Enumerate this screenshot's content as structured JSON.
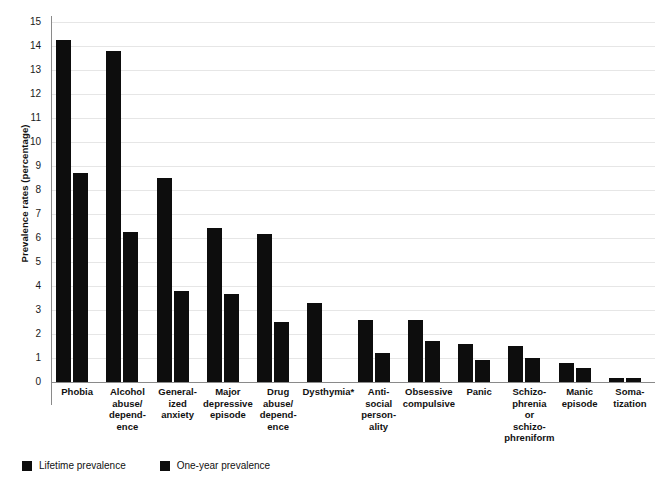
{
  "chart_data": {
    "type": "bar",
    "title": "",
    "subtitle": "",
    "xlabel": "",
    "ylabel": "Prevalence rates (percentage)",
    "ylim": [
      0,
      15
    ],
    "ytick_labels": [
      "0",
      "1",
      "2",
      "3",
      "4",
      "5",
      "6",
      "7",
      "8",
      "9",
      "10",
      "11",
      "12",
      "13",
      "14",
      "15"
    ],
    "ytick_values": [
      0,
      1,
      2,
      3,
      4,
      5,
      6,
      7,
      8,
      9,
      10,
      11,
      12,
      13,
      14,
      15
    ],
    "grid": true,
    "legend_position": "bottom-left",
    "bar_color": "#0d0d0d",
    "categories": [
      "Phobia",
      "Alcohol\nabuse/\ndepend-\nence",
      "General-\nized\nanxiety",
      "Major\ndepressive\nepisode",
      "Drug\nabuse/\ndepend-\nence",
      "Dysthymia*",
      "Anti-\nsocial\nperson-\nality",
      "Obsessive\ncompulsive",
      "Panic",
      "Schizo-\nphrenia\nor\nschizo-\nphreniform",
      "Manic\nepisode",
      "Soma-\ntization"
    ],
    "series": [
      {
        "name": "Lifetime prevalence",
        "values": [
          14.25,
          13.8,
          8.5,
          6.4,
          6.15,
          3.3,
          2.6,
          2.6,
          1.6,
          1.5,
          0.8,
          0.15
        ]
      },
      {
        "name": "One-year prevalence",
        "values": [
          8.7,
          6.25,
          3.8,
          3.65,
          2.5,
          null,
          1.2,
          1.7,
          0.9,
          1.0,
          0.6,
          0.15
        ]
      }
    ],
    "annotations": [
      "* Dysthymia one-year prevalence not reported"
    ]
  },
  "legend": {
    "items": [
      {
        "label": "Lifetime prevalence",
        "color": "#0d0d0d"
      },
      {
        "label": "One-year prevalence",
        "color": "#0d0d0d"
      }
    ]
  }
}
